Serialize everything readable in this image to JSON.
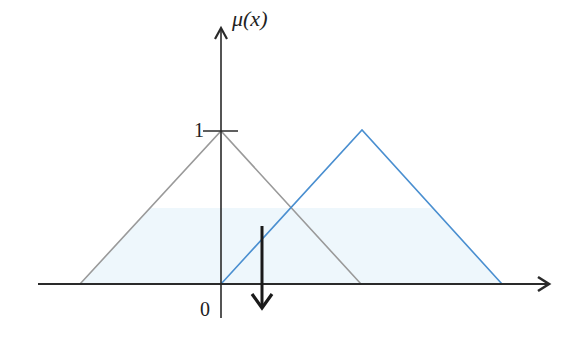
{
  "diagram": {
    "type": "fuzzy-membership-functions",
    "y_axis_label": "μ(x)",
    "y_tick_label_one": "1",
    "origin_label": "0",
    "colors": {
      "axis": "#2a2a2a",
      "gray_triangle": "#9a9a9a",
      "blue_triangle": "#4a8fd0",
      "shading": "#eef7fc",
      "arrow": "#1a1a1a"
    },
    "shapes": [
      {
        "name": "gray-triangle",
        "base_left": 80,
        "peak_x": 221,
        "peak_y": 131,
        "base_right": 361
      },
      {
        "name": "blue-triangle",
        "base_left": 221,
        "peak_x": 362,
        "peak_y": 130,
        "base_right": 502
      }
    ],
    "shaded_band": {
      "top_y": 208,
      "bottom_y": 284
    },
    "down_arrow": {
      "x": 262,
      "y_top": 226,
      "y_bottom": 308
    }
  }
}
